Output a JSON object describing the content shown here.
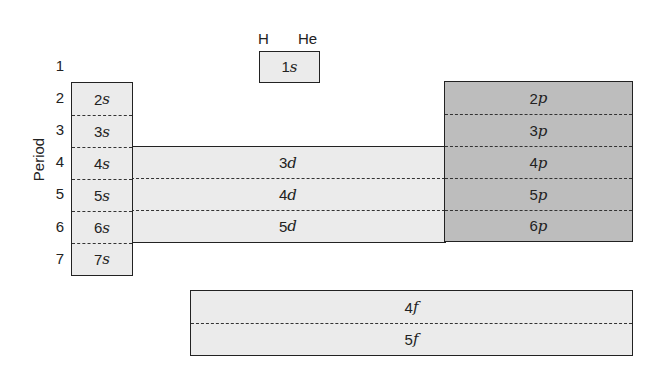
{
  "axis": {
    "label": "Period"
  },
  "periods": [
    "1",
    "2",
    "3",
    "4",
    "5",
    "6",
    "7"
  ],
  "elements_top": {
    "h": "H",
    "he": "He"
  },
  "blocks": {
    "s1": {
      "rows": [
        {
          "n": "1",
          "l": "s"
        }
      ]
    },
    "s": {
      "rows": [
        {
          "n": "2",
          "l": "s"
        },
        {
          "n": "3",
          "l": "s"
        },
        {
          "n": "4",
          "l": "s"
        },
        {
          "n": "5",
          "l": "s"
        },
        {
          "n": "6",
          "l": "s"
        },
        {
          "n": "7",
          "l": "s"
        }
      ]
    },
    "d": {
      "rows": [
        {
          "n": "3",
          "l": "d"
        },
        {
          "n": "4",
          "l": "d"
        },
        {
          "n": "5",
          "l": "d"
        }
      ]
    },
    "p": {
      "rows": [
        {
          "n": "2",
          "l": "p"
        },
        {
          "n": "3",
          "l": "p"
        },
        {
          "n": "4",
          "l": "p"
        },
        {
          "n": "5",
          "l": "p"
        },
        {
          "n": "6",
          "l": "p"
        }
      ]
    },
    "f": {
      "rows": [
        {
          "n": "4",
          "l": "f"
        },
        {
          "n": "5",
          "l": "f"
        }
      ]
    }
  },
  "colors": {
    "s_d_f_fill": "#ebebeb",
    "p_fill": "#bdbdbd",
    "border": "#222222"
  }
}
